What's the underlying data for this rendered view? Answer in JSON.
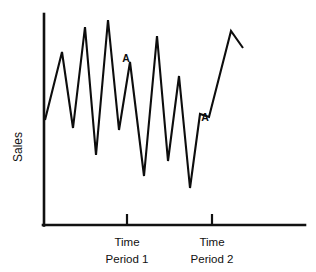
{
  "chart_data": {
    "type": "line",
    "title": "",
    "subtitle": "",
    "xlabel": "",
    "ylabel": "Sales",
    "grid": false,
    "legend": null,
    "xlim": [
      0,
      100
    ],
    "ylim": [
      0,
      100
    ],
    "axis_ticks_labeled": false,
    "x_tick_labels": [
      "Time Period 1",
      "Time Period 2"
    ],
    "x_tick_label_lines": [
      [
        "Time",
        "Period 1"
      ],
      [
        "Time",
        "Period 2"
      ]
    ],
    "x_tick_positions": [
      32,
      65
    ],
    "series": [
      {
        "name": "Sales",
        "x": [
          1,
          5,
          9,
          14,
          18,
          23,
          27,
          32,
          36,
          41,
          45,
          50,
          54,
          58,
          63,
          67,
          72,
          79,
          88,
          94
        ],
        "values": [
          51,
          78,
          39,
          90,
          29,
          95,
          38,
          71,
          8,
          88,
          18,
          69,
          3,
          47,
          45,
          73,
          92,
          78,
          100,
          55
        ],
        "points": [
          {
            "x": 45,
            "y": 120
          },
          {
            "x": 62,
            "y": 52
          },
          {
            "x": 73,
            "y": 128
          },
          {
            "x": 85,
            "y": 27
          },
          {
            "x": 96,
            "y": 155
          },
          {
            "x": 108,
            "y": 20
          },
          {
            "x": 119,
            "y": 130
          },
          {
            "x": 130,
            "y": 62
          },
          {
            "x": 144,
            "y": 176
          },
          {
            "x": 157,
            "y": 36
          },
          {
            "x": 168,
            "y": 161
          },
          {
            "x": 179,
            "y": 76
          },
          {
            "x": 190,
            "y": 188
          },
          {
            "x": 200,
            "y": 114
          },
          {
            "x": 209,
            "y": 117
          },
          {
            "x": 231,
            "y": 31
          },
          {
            "x": 243,
            "y": 48
          }
        ]
      }
    ],
    "annotations": [
      {
        "label": "A",
        "x": 130,
        "y": 62,
        "note": "peak at end of time period 1"
      },
      {
        "label": "A",
        "x": 209,
        "y": 117,
        "note": "point at time period 2"
      }
    ],
    "colors": {
      "line": "#0d0d0d",
      "axis": "#111111",
      "background": "#ffffff",
      "text": "#111111"
    }
  },
  "axes": {
    "y_label": "Sales",
    "x_tick_1_line_1": "Time",
    "x_tick_1_line_2": "Period 1",
    "x_tick_2_line_1": "Time",
    "x_tick_2_line_2": "Period 2"
  },
  "annotations": {
    "marker_a_1": "A",
    "marker_a_2": "A"
  }
}
